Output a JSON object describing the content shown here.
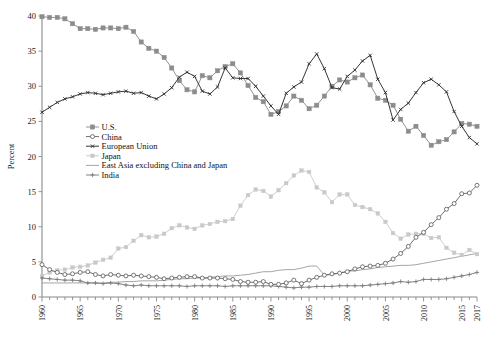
{
  "chart_data": {
    "type": "line",
    "title": "",
    "subtitle": "",
    "xlabel": "",
    "ylabel": "Percent",
    "xlim": [
      1960,
      2017
    ],
    "ylim": [
      0,
      40
    ],
    "yticks": [
      0,
      5,
      10,
      15,
      20,
      25,
      30,
      35,
      40
    ],
    "ytick_labels": [
      "0",
      "5",
      "10",
      "15",
      "20",
      "25",
      "30",
      "35",
      "40"
    ],
    "xtick_labels": [
      "1960",
      "1965",
      "1970",
      "1975",
      "1980",
      "1985",
      "1990",
      "1995",
      "2000",
      "2005",
      "2010",
      "2015",
      "2017"
    ],
    "xtick_values": [
      1960,
      1965,
      1970,
      1975,
      1980,
      1985,
      1990,
      1995,
      2000,
      2005,
      2010,
      2015,
      2017
    ],
    "grid": false,
    "legend_position": "center-left",
    "x": [
      1960,
      1961,
      1962,
      1963,
      1964,
      1965,
      1966,
      1967,
      1968,
      1969,
      1970,
      1971,
      1972,
      1973,
      1974,
      1975,
      1976,
      1977,
      1978,
      1979,
      1980,
      1981,
      1982,
      1983,
      1984,
      1985,
      1986,
      1987,
      1988,
      1989,
      1990,
      1991,
      1992,
      1993,
      1994,
      1995,
      1996,
      1997,
      1998,
      1999,
      2000,
      2001,
      2002,
      2003,
      2004,
      2005,
      2006,
      2007,
      2008,
      2009,
      2010,
      2011,
      2012,
      2013,
      2014,
      2015,
      2016,
      2017
    ],
    "series": [
      {
        "name": "U.S.",
        "marker": "filled-square",
        "color": "#8c8c8c",
        "values": [
          39.9,
          39.8,
          39.8,
          39.6,
          38.9,
          38.2,
          38.2,
          38.1,
          38.3,
          38.3,
          38.2,
          38.4,
          37.8,
          36.3,
          35.4,
          35.0,
          34.1,
          32.6,
          30.8,
          29.5,
          29.2,
          31.5,
          31.2,
          32.2,
          32.8,
          33.2,
          31.9,
          30.1,
          28.4,
          27.8,
          26.0,
          26.4,
          27.2,
          28.6,
          28.0,
          26.8,
          27.3,
          28.6,
          30.0,
          30.9,
          30.6,
          31.2,
          31.6,
          30.2,
          28.3,
          28.0,
          27.3,
          25.3,
          23.6,
          24.3,
          23.0,
          21.6,
          22.1,
          22.4,
          23.5,
          24.7,
          24.6,
          24.3
        ]
      },
      {
        "name": "China",
        "marker": "open-circle",
        "color": "#666666",
        "values": [
          4.6,
          3.9,
          3.5,
          3.2,
          3.3,
          3.5,
          3.6,
          3.2,
          3.0,
          3.2,
          3.1,
          3.0,
          3.1,
          3.0,
          2.9,
          2.8,
          2.6,
          2.7,
          2.8,
          2.9,
          2.9,
          2.7,
          2.7,
          2.7,
          2.6,
          2.5,
          2.2,
          2.1,
          2.1,
          2.2,
          1.8,
          1.8,
          2.0,
          2.4,
          1.9,
          2.4,
          2.8,
          3.1,
          3.3,
          3.4,
          3.6,
          4.0,
          4.3,
          4.4,
          4.5,
          4.8,
          5.4,
          6.2,
          7.2,
          8.5,
          9.2,
          10.3,
          11.3,
          12.5,
          13.3,
          14.7,
          14.8,
          15.9
        ]
      },
      {
        "name": "European Union",
        "marker": "small-x",
        "color": "#2b2b2b",
        "values": [
          26.3,
          27.0,
          27.7,
          28.2,
          28.5,
          28.9,
          29.1,
          29.0,
          28.8,
          29.0,
          29.2,
          29.3,
          29.0,
          29.1,
          28.6,
          28.2,
          28.9,
          29.8,
          31.3,
          32.0,
          31.4,
          29.3,
          28.9,
          29.9,
          32.6,
          31.2,
          31.1,
          31.1,
          30.0,
          28.6,
          27.2,
          26.0,
          29.0,
          29.9,
          30.6,
          33.2,
          34.6,
          32.5,
          29.8,
          29.6,
          31.4,
          32.3,
          33.6,
          34.4,
          31.0,
          29.1,
          25.2,
          26.7,
          27.6,
          29.1,
          30.5,
          31.0,
          30.2,
          29.2,
          26.4,
          24.3,
          22.7,
          21.8
        ]
      },
      {
        "name": "Japan",
        "marker": "light-dot",
        "color": "#c9c9c9",
        "values": [
          3.0,
          3.5,
          3.8,
          3.9,
          4.2,
          4.3,
          4.5,
          4.9,
          5.3,
          5.6,
          6.9,
          7.1,
          8.0,
          8.8,
          8.5,
          8.6,
          9.0,
          9.8,
          10.2,
          9.9,
          9.7,
          10.2,
          10.4,
          10.7,
          10.8,
          11.1,
          13.0,
          14.5,
          15.3,
          15.1,
          14.3,
          15.2,
          16.2,
          17.3,
          18.0,
          17.8,
          15.6,
          14.9,
          13.5,
          14.6,
          14.6,
          13.1,
          12.8,
          12.5,
          11.9,
          10.7,
          9.1,
          8.3,
          8.9,
          9.0,
          9.0,
          8.4,
          8.5,
          7.0,
          6.3,
          6.0,
          6.7,
          6.1
        ]
      },
      {
        "name": "East Asia excluding China and Japan",
        "marker": "plain-line",
        "color": "#a0a0a0",
        "values": [
          2.0,
          2.0,
          2.0,
          2.0,
          2.0,
          2.0,
          2.0,
          2.0,
          2.0,
          2.1,
          2.1,
          2.2,
          2.2,
          2.3,
          2.3,
          2.3,
          2.4,
          2.5,
          2.6,
          2.6,
          2.7,
          2.7,
          2.8,
          2.9,
          3.0,
          3.0,
          3.1,
          3.2,
          3.4,
          3.6,
          3.6,
          3.8,
          3.9,
          3.9,
          4.1,
          4.4,
          4.4,
          3.1,
          3.2,
          3.4,
          3.7,
          3.7,
          3.9,
          4.0,
          4.2,
          4.3,
          4.4,
          4.5,
          4.5,
          4.6,
          4.8,
          5.0,
          5.2,
          5.4,
          5.6,
          5.8,
          6.0,
          6.2
        ]
      },
      {
        "name": "India",
        "marker": "plus",
        "color": "#7d7d7d",
        "values": [
          2.7,
          2.6,
          2.5,
          2.4,
          2.4,
          2.3,
          2.0,
          2.0,
          1.9,
          2.0,
          1.9,
          1.7,
          1.6,
          1.7,
          1.6,
          1.6,
          1.6,
          1.6,
          1.6,
          1.5,
          1.6,
          1.6,
          1.6,
          1.6,
          1.5,
          1.6,
          1.6,
          1.6,
          1.6,
          1.6,
          1.6,
          1.5,
          1.4,
          1.3,
          1.4,
          1.4,
          1.5,
          1.5,
          1.5,
          1.6,
          1.6,
          1.6,
          1.6,
          1.7,
          1.8,
          1.9,
          2.0,
          2.2,
          2.1,
          2.2,
          2.5,
          2.5,
          2.5,
          2.6,
          2.8,
          3.0,
          3.2,
          3.5
        ]
      }
    ],
    "legend": [
      {
        "label": "U.S.",
        "marker": "filled-square",
        "color": "#8c8c8c"
      },
      {
        "label": "China",
        "marker": "open-circle",
        "color": "#666666"
      },
      {
        "label": "European Union",
        "marker": "small-x",
        "color": "#2b2b2b"
      },
      {
        "label": "Japan",
        "marker": "light-dot",
        "color": "#c9c9c9"
      },
      {
        "label": "East Asia excluding China and Japan",
        "marker": "plain-line",
        "color": "#a0a0a0"
      },
      {
        "label": "India",
        "marker": "plus",
        "color": "#7d7d7d"
      }
    ]
  }
}
